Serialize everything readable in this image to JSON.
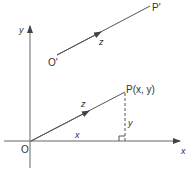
{
  "diagram": {
    "type": "vector-displacement",
    "labels": {
      "y_axis": "y",
      "x_axis": "x",
      "origin": "O",
      "origin_prime": "O'",
      "point_prime": "P'",
      "point": "P(x, y)",
      "vector_upper": "z",
      "vector_lower": "z",
      "horizontal_component": "x",
      "vertical_component": "y"
    },
    "colors": {
      "line": "#555555",
      "text": "#333333"
    }
  }
}
